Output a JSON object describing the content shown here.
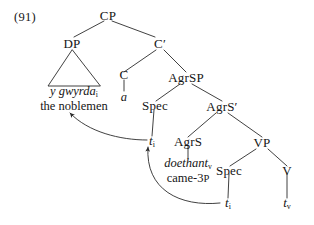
{
  "example": {
    "number": "(91)"
  },
  "tree": {
    "nodes": {
      "cp": "CP",
      "dp": "DP",
      "cbar": "C′",
      "c": "C",
      "agrsp": "AgrSP",
      "spec_agrsp": "Spec",
      "agrsbar": "AgrS′",
      "agrs": "AgrS",
      "vp": "VP",
      "spec_vp": "Spec",
      "v": "V"
    },
    "lexical": {
      "dp_welsh": "y gwyrda",
      "dp_welsh_index": "i",
      "dp_gloss": "the noblemen",
      "c_head": "a",
      "agrs_welsh": "doethant",
      "agrs_welsh_index": "v",
      "agrs_gloss_stem": "came-3",
      "agrs_gloss_smallcap": "p"
    },
    "traces": {
      "t_spec_agrsp": "t",
      "t_spec_agrsp_index": "i",
      "t_spec_vp": "t",
      "t_spec_vp_index": "i",
      "t_v": "t",
      "t_v_index": "v"
    }
  },
  "style": {
    "line_color": "#2b2b2b",
    "text_color": "#151515",
    "background": "#ffffff"
  }
}
